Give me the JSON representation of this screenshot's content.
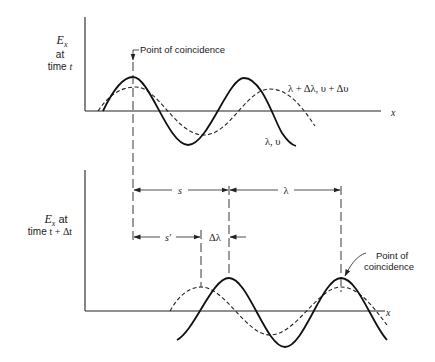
{
  "top_panel": {
    "ylabel_line1": "E",
    "ylabel_sub": "x",
    "ylabel_line2": "at",
    "ylabel_line3_prefix": "time ",
    "ylabel_line3_var": "t",
    "xlabel": "x",
    "annotation": "Point of coincidence",
    "label_solid": "λ, υ",
    "label_dashed": "λ + Δλ, υ + Δυ"
  },
  "bottom_panel": {
    "ylabel_line1": "E",
    "ylabel_sub": "x",
    "ylabel_line1_suffix": " at",
    "ylabel_line2_prefix": "time ",
    "ylabel_line2_var": "t + Δt",
    "xlabel": "x",
    "annotation_line1": "Point of",
    "annotation_line2": "coincidence"
  },
  "dimensions": {
    "s": "s",
    "lambda": "λ",
    "s_prime": "s′",
    "delta_lambda": "Δλ"
  },
  "legend": [
    {
      "style": "solid",
      "label": "λ, υ"
    },
    {
      "style": "dashed",
      "label": "λ + Δλ, υ + Δυ"
    }
  ]
}
